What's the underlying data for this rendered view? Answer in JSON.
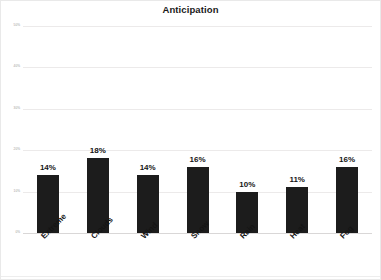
{
  "chart_data": {
    "type": "bar",
    "title": "Anticipation",
    "xlabel": "",
    "ylabel": "",
    "categories": [
      "Extreme",
      "Clouds",
      "Wind",
      "Snow",
      "Rain",
      "Heat",
      "Fog"
    ],
    "values": [
      14,
      18,
      14,
      16,
      10,
      11,
      16
    ],
    "data_labels": [
      "14%",
      "18%",
      "14%",
      "16%",
      "10%",
      "11%",
      "16%"
    ],
    "ylim": [
      0,
      50
    ],
    "ytick_values": [
      50,
      40,
      30,
      20,
      10,
      0
    ],
    "ytick_labels": [
      "50%",
      "40%",
      "30%",
      "20%",
      "10%",
      "0%"
    ],
    "grid": true,
    "legend": false,
    "bar_color": "#1c1c1c",
    "gridline_color": "#eceaea",
    "background_color": "#ffffff",
    "label_rotation": -45
  }
}
